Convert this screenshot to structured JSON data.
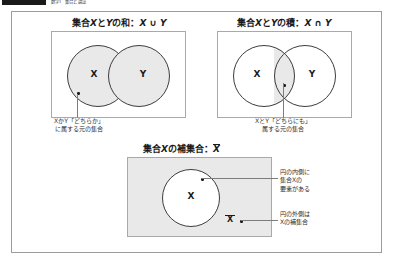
{
  "header": {
    "chip_label": "",
    "title": "数学Ⅰ　集合と論証"
  },
  "panels": {
    "union": {
      "title_prefix": "集合",
      "title_var_x": "X",
      "title_mid": "と",
      "title_var_y": "Y",
      "title_suffix": "の和：",
      "title_expr": "X ∪ Y",
      "label_x": "X",
      "label_y": "Y",
      "caption_line1": "XかY「どちらか」",
      "caption_line2": "に属する元の集合"
    },
    "intersection": {
      "title_prefix": "集合",
      "title_var_x": "X",
      "title_mid": "と",
      "title_var_y": "Y",
      "title_suffix": "の積：",
      "title_expr": "X ∩ Y",
      "label_x": "X",
      "label_y": "Y",
      "caption_line1": "XとY「どちらにも」",
      "caption_line2": "属する元の集合"
    },
    "complement": {
      "title_prefix": "集合",
      "title_var_x": "X",
      "title_suffix": "の補集合：",
      "title_expr": "X",
      "label_x": "X",
      "label_complement": "X",
      "annot1_line1": "円の内側に",
      "annot1_line2": "集合Xの",
      "annot1_line3": "要素がある",
      "annot2_line1": "円の外側は",
      "annot2_line2": "Xの補集合",
      "annot3": "Xの補集合"
    }
  },
  "colors": {
    "shade": "#e9e9e9",
    "stroke": "#3d3d3d",
    "box_border": "#a9a9a9",
    "frame_border": "#9c9c9c",
    "text": "#231f20"
  }
}
